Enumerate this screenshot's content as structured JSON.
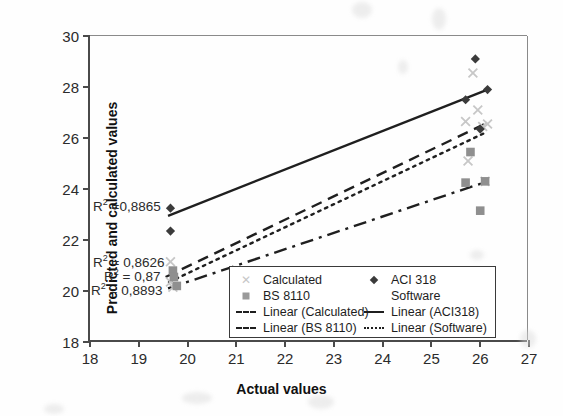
{
  "chart_data": {
    "type": "scatter",
    "title": "",
    "xlabel": "Actual values",
    "ylabel": "Predicted and calculated values",
    "xlim": [
      18,
      27
    ],
    "ylim": [
      18,
      30
    ],
    "xticks": [
      18,
      19,
      20,
      21,
      22,
      23,
      24,
      25,
      26,
      27
    ],
    "yticks": [
      18,
      20,
      22,
      24,
      26,
      28,
      30
    ],
    "grid": false,
    "legend_position": "inside-bottom-center",
    "series": [
      {
        "name": "Calculated",
        "marker": "x-light",
        "color": "#c7c7c7",
        "points": [
          {
            "x": 19.65,
            "y": 21.15
          },
          {
            "x": 19.65,
            "y": 20.35
          },
          {
            "x": 19.7,
            "y": 20.15
          },
          {
            "x": 25.7,
            "y": 26.65
          },
          {
            "x": 25.75,
            "y": 25.1
          },
          {
            "x": 25.85,
            "y": 28.55
          },
          {
            "x": 25.95,
            "y": 27.1
          },
          {
            "x": 26.05,
            "y": 26.45
          },
          {
            "x": 26.1,
            "y": 24.3
          },
          {
            "x": 26.15,
            "y": 26.55
          }
        ]
      },
      {
        "name": "ACI 318",
        "marker": "diamond",
        "color": "#3b3b3b",
        "points": [
          {
            "x": 19.65,
            "y": 23.25
          },
          {
            "x": 19.65,
            "y": 22.35
          },
          {
            "x": 25.7,
            "y": 27.5
          },
          {
            "x": 25.9,
            "y": 29.1
          },
          {
            "x": 26.0,
            "y": 26.35
          },
          {
            "x": 26.15,
            "y": 27.9
          }
        ]
      },
      {
        "name": "BS 8110",
        "marker": "square",
        "color": "#8f8f8f",
        "points": [
          {
            "x": 19.7,
            "y": 20.8
          },
          {
            "x": 19.72,
            "y": 20.55
          },
          {
            "x": 19.78,
            "y": 20.2
          },
          {
            "x": 25.7,
            "y": 24.25
          },
          {
            "x": 25.8,
            "y": 25.45
          },
          {
            "x": 26.0,
            "y": 23.15
          },
          {
            "x": 26.1,
            "y": 24.3
          }
        ]
      },
      {
        "name": "Software",
        "marker": "none",
        "color": "#bdbdbd",
        "points": []
      }
    ],
    "trendlines": [
      {
        "name": "Linear (Calculated)",
        "style": "dashed",
        "x0": 19.55,
        "y0": 20.55,
        "x1": 26.15,
        "y1": 26.6,
        "r2": "0,8626"
      },
      {
        "name": "Linear (ACI318)",
        "style": "solid",
        "x0": 19.6,
        "y0": 22.95,
        "x1": 26.15,
        "y1": 27.9,
        "r2": "0,8865"
      },
      {
        "name": "Linear (BS 8110)",
        "style": "dash-dot",
        "x0": 19.6,
        "y0": 20.1,
        "x1": 26.15,
        "y1": 24.3,
        "r2": "0,8893"
      },
      {
        "name": "Linear (Software)",
        "style": "dotted",
        "x0": 19.62,
        "y0": 20.35,
        "x1": 26.15,
        "y1": 26.25,
        "r2": "0,87"
      }
    ],
    "annotations": [
      {
        "id": "r2-aci",
        "text_prefix": "R",
        "text_sup": "2",
        "text_suffix": " =0,8865",
        "value": "0,8865"
      },
      {
        "id": "r2-calc",
        "text_prefix": "R",
        "text_sup": "2",
        "text_suffix": " = 0,8626",
        "value": "0,8626"
      },
      {
        "id": "r2-soft",
        "text_prefix": "R",
        "text_sup": "2",
        "text_suffix": " = 0,87",
        "value": "0,87"
      },
      {
        "id": "r2-bs",
        "text_prefix": "R",
        "text_sup": "2",
        "text_suffix": " = 0,8893",
        "value": "0,8893"
      }
    ]
  },
  "axes": {
    "y_title": "Predicted and calculated values",
    "x_title": "Actual values",
    "y_labels": [
      "30",
      "28",
      "26",
      "24",
      "22",
      "20",
      "18"
    ],
    "x_labels": [
      "18",
      "19",
      "20",
      "21",
      "22",
      "23",
      "24",
      "25",
      "26",
      "27"
    ]
  },
  "annotations_text": {
    "r2_aci": " =0,8865",
    "r2_calc": " = 0,8626",
    "r2_soft": " = 0,87",
    "r2_bs": " = 0,8893",
    "r_letter": "R",
    "sup2": "2"
  },
  "legend": {
    "col1": [
      {
        "label": "Calculated",
        "symbol": "x-marker"
      },
      {
        "label": "BS 8110",
        "symbol": "square-marker"
      },
      {
        "label": "Linear (Calculated)",
        "symbol": "dashed-line"
      },
      {
        "label": "Linear (BS 8110)",
        "symbol": "dash-dot-line"
      }
    ],
    "col2": [
      {
        "label": "ACI 318",
        "symbol": "diamond-marker"
      },
      {
        "label": "Software",
        "symbol": "blank-marker"
      },
      {
        "label": "Linear (ACI318)",
        "symbol": "solid-line"
      },
      {
        "label": "Linear (Software)",
        "symbol": "dotted-line"
      }
    ]
  },
  "colors": {
    "axis": "#4a4a4a",
    "calculated": "#c7c7c7",
    "aci318": "#3b3b3b",
    "bs8110": "#8f8f8f",
    "software": "#bdbdbd",
    "line": "#1f1f1f"
  }
}
